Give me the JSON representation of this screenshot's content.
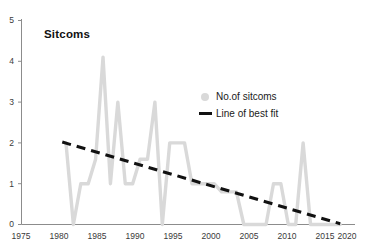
{
  "chart_data": {
    "type": "line",
    "title": "Sitcoms",
    "xlabel": "",
    "ylabel": "",
    "xlim": [
      1975,
      2020
    ],
    "ylim": [
      0,
      5
    ],
    "xticks": [
      1975,
      1980,
      1985,
      1990,
      1995,
      2000,
      2005,
      2010,
      2015,
      2020
    ],
    "yticks": [
      0,
      1,
      2,
      3,
      4,
      5
    ],
    "grid": false,
    "legend_position": "center-right",
    "legend": [
      {
        "label": "No.of sitcoms",
        "marker": "dot",
        "color": "#d9d9d9"
      },
      {
        "label": "Line of best fit",
        "marker": "dash",
        "color": "#111111"
      }
    ],
    "series": [
      {
        "name": "No.of sitcoms",
        "type": "line",
        "color": "#d9d9d9",
        "x": [
          1981,
          1982,
          1983,
          1984,
          1985,
          1986,
          1987,
          1988,
          1989,
          1990,
          1991,
          1992,
          1993,
          1994,
          1995,
          1996,
          1997,
          1998,
          1999,
          2000,
          2001,
          2002,
          2003,
          2004,
          2005,
          2006,
          2007,
          2008,
          2009,
          2010,
          2011,
          2012,
          2013,
          2014,
          2015,
          2016,
          2017,
          2018
        ],
        "values": [
          2,
          0,
          1,
          1,
          1.6,
          4.1,
          1,
          3,
          1,
          1,
          1.6,
          1.6,
          3,
          0,
          2,
          2,
          2,
          1,
          1,
          1,
          1,
          0.8,
          0.8,
          0.8,
          0,
          0,
          0,
          0,
          1,
          1,
          0,
          0,
          2,
          0,
          0,
          0,
          0,
          0
        ]
      },
      {
        "name": "Line of best fit",
        "type": "line",
        "style": "dashed",
        "color": "#111111",
        "x": [
          1980.5,
          2018
        ],
        "values": [
          2.02,
          0.02
        ]
      }
    ]
  },
  "axes": {
    "y_tick_labels": [
      "5",
      "4",
      "3",
      "2",
      "1",
      "0"
    ],
    "x_tick_labels": [
      "1975",
      "1980",
      "1985",
      "1990",
      "1995",
      "2000",
      "2005",
      "2010",
      "2015",
      "2020"
    ]
  },
  "colors": {
    "series": "#d9d9d9",
    "trend": "#111111",
    "axis": "#888888",
    "text": "#1a1a1a"
  }
}
